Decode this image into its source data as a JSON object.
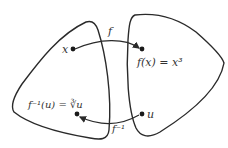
{
  "diagram": {
    "domain_set": {
      "point_label": "x",
      "inverse_label": "f⁻¹(u) = ∛u"
    },
    "codomain_set": {
      "point_label": "u",
      "image_label": "f(x) = x³"
    },
    "arrows": {
      "forward": {
        "label": "f"
      },
      "inverse": {
        "label": "f⁻¹"
      }
    },
    "colors": {
      "stroke": "#2a2a2a",
      "text": "#333333",
      "background": "#ffffff"
    }
  }
}
